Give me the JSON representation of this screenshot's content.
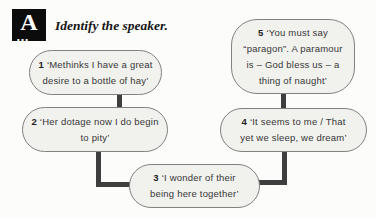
{
  "header": {
    "logo_letter": "A",
    "logo_dots": "…",
    "title": "Identify the speaker."
  },
  "bubbles": [
    {
      "number": "1",
      "lines": [
        "‘Methinks I have a great",
        "desire to a bottle of hay’"
      ]
    },
    {
      "number": "2",
      "lines": [
        "‘Her dotage now I do begin",
        "to pity’"
      ]
    },
    {
      "number": "3",
      "lines": [
        "‘I wonder of their",
        "being here together’"
      ]
    },
    {
      "number": "4",
      "lines": [
        "‘It seems to me / That",
        "yet we sleep, we dream’"
      ]
    },
    {
      "number": "5",
      "lines": [
        "‘You must say",
        "“paragon”. A paramour",
        "is – God bless us – a",
        "thing of naught’"
      ]
    }
  ],
  "colors": {
    "background": "#fcfcfa",
    "bubble_fill": "#f1f1ee",
    "bubble_border": "#818181",
    "connector": "#3e3e3e",
    "logo_background": "#0c0c0c",
    "text": "#373737"
  }
}
